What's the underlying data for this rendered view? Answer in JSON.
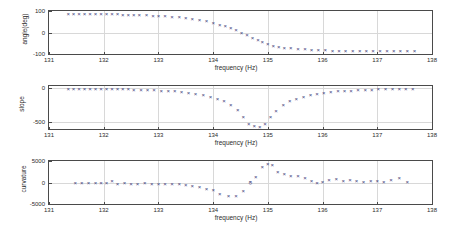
{
  "figure": {
    "background": "#ffffff",
    "marker_color": "#3b3b7a",
    "axis_color": "#4a4a4a",
    "grid_color": "#d8d8d8",
    "xlabel": "frequency (Hz)"
  },
  "chart_data": [
    {
      "type": "scatter",
      "index": 0,
      "title": "",
      "xlabel": "frequency (Hz)",
      "ylabel": "angle(deg)",
      "xlim": [
        131,
        138
      ],
      "ylim": [
        -100,
        100
      ],
      "xticks": [
        131,
        132,
        133,
        134,
        135,
        136,
        137,
        138
      ],
      "xticklabels": [
        "131",
        "132",
        "133",
        "134",
        "135",
        "136",
        "137",
        "138"
      ],
      "yticks": [
        -100,
        0,
        100
      ],
      "yticklabels": [
        "-100",
        "0",
        "100"
      ],
      "grid": true,
      "marker": "x",
      "x": [
        131.35,
        131.45,
        131.55,
        131.65,
        131.75,
        131.85,
        131.95,
        132.05,
        132.15,
        132.25,
        132.35,
        132.45,
        132.55,
        132.65,
        132.78,
        132.9,
        133.0,
        133.12,
        133.25,
        133.38,
        133.5,
        133.62,
        133.75,
        133.88,
        134.0,
        134.12,
        134.22,
        134.32,
        134.42,
        134.52,
        134.62,
        134.72,
        134.82,
        134.9,
        135.0,
        135.1,
        135.2,
        135.3,
        135.42,
        135.55,
        135.68,
        135.8,
        135.92,
        136.05,
        136.18,
        136.3,
        136.42,
        136.55,
        136.68,
        136.8,
        136.92,
        137.05,
        137.18,
        137.3,
        137.42,
        137.55,
        137.68
      ],
      "y": [
        86,
        87,
        86,
        87,
        86,
        87,
        88,
        86,
        85,
        84,
        83,
        82,
        82,
        81,
        80,
        78,
        78,
        75,
        73,
        70,
        67,
        63,
        58,
        52,
        45,
        36,
        28,
        20,
        10,
        0,
        -12,
        -24,
        -36,
        -46,
        -54,
        -61,
        -66,
        -70,
        -74,
        -77,
        -79,
        -81,
        -82,
        -83,
        -84,
        -84,
        -85,
        -85,
        -85,
        -85,
        -86,
        -86,
        -86,
        -86,
        -86,
        -86,
        -86
      ]
    },
    {
      "type": "scatter",
      "index": 1,
      "title": "",
      "xlabel": "frequency (Hz)",
      "ylabel": "slope",
      "xlim": [
        131,
        138
      ],
      "ylim": [
        -600,
        30
      ],
      "xticks": [
        131,
        132,
        133,
        134,
        135,
        136,
        137,
        138
      ],
      "xticklabels": [
        "131",
        "132",
        "133",
        "134",
        "135",
        "136",
        "137",
        "138"
      ],
      "yticks": [
        -500,
        0
      ],
      "yticklabels": [
        "-500",
        "0"
      ],
      "grid": true,
      "marker": "x",
      "x": [
        131.35,
        131.45,
        131.55,
        131.65,
        131.75,
        131.85,
        131.95,
        132.05,
        132.15,
        132.25,
        132.35,
        132.45,
        132.55,
        132.68,
        132.8,
        132.92,
        133.05,
        133.18,
        133.3,
        133.42,
        133.55,
        133.68,
        133.82,
        133.95,
        134.08,
        134.2,
        134.32,
        134.45,
        134.55,
        134.65,
        134.75,
        134.85,
        134.95,
        135.05,
        135.15,
        135.28,
        135.4,
        135.52,
        135.65,
        135.78,
        135.9,
        136.02,
        136.15,
        136.28,
        136.4,
        136.52,
        136.65,
        136.78,
        136.9,
        137.02,
        137.15,
        137.28,
        137.4,
        137.52,
        137.65
      ],
      "y": [
        -8,
        -10,
        -9,
        -11,
        -10,
        -12,
        -13,
        -12,
        -14,
        -16,
        -18,
        -20,
        -22,
        -25,
        -28,
        -32,
        -36,
        -42,
        -48,
        -56,
        -68,
        -82,
        -100,
        -124,
        -155,
        -196,
        -252,
        -325,
        -420,
        -520,
        -560,
        -570,
        -520,
        -430,
        -330,
        -250,
        -195,
        -155,
        -125,
        -100,
        -82,
        -68,
        -58,
        -50,
        -42,
        -36,
        -30,
        -26,
        -22,
        -20,
        -17,
        -15,
        -13,
        -12,
        -10
      ]
    },
    {
      "type": "scatter",
      "index": 2,
      "title": "",
      "xlabel": "frequency (Hz)",
      "ylabel": "curvature",
      "xlim": [
        131,
        138
      ],
      "ylim": [
        -5000,
        5000
      ],
      "xticks": [
        131,
        132,
        133,
        134,
        135,
        136,
        137,
        138
      ],
      "xticklabels": [
        "131",
        "132",
        "133",
        "134",
        "135",
        "136",
        "137",
        "138"
      ],
      "yticks": [
        -5000,
        0,
        5000
      ],
      "yticklabels": [
        "-5000",
        "0",
        "5000"
      ],
      "grid": true,
      "marker": "x",
      "highlight_marker": "o",
      "highlight_point": {
        "x": 134.68,
        "y": 120
      },
      "x": [
        131.48,
        131.6,
        131.72,
        131.85,
        131.95,
        132.05,
        132.15,
        132.25,
        132.38,
        132.5,
        132.62,
        132.75,
        132.88,
        133.0,
        133.12,
        133.25,
        133.38,
        133.5,
        133.62,
        133.75,
        133.88,
        134.0,
        134.12,
        134.28,
        134.42,
        134.55,
        134.68,
        134.78,
        134.9,
        135.0,
        135.08,
        135.18,
        135.3,
        135.42,
        135.55,
        135.68,
        135.8,
        135.9,
        136.0,
        136.12,
        136.25,
        136.38,
        136.5,
        136.62,
        136.75,
        136.88,
        137.0,
        137.12,
        137.25,
        137.4,
        137.55
      ],
      "y": [
        -120,
        -200,
        -150,
        -230,
        -180,
        -120,
        420,
        -250,
        -200,
        -300,
        -280,
        -220,
        -350,
        -280,
        -340,
        -420,
        -430,
        -600,
        -780,
        -1150,
        -1600,
        -1700,
        -2600,
        -3100,
        -3200,
        -2000,
        100,
        1300,
        3700,
        4200,
        4100,
        2500,
        1900,
        1500,
        1600,
        1000,
        250,
        -100,
        200,
        600,
        900,
        250,
        500,
        300,
        200,
        400,
        300,
        200,
        600,
        950,
        150
      ]
    }
  ]
}
